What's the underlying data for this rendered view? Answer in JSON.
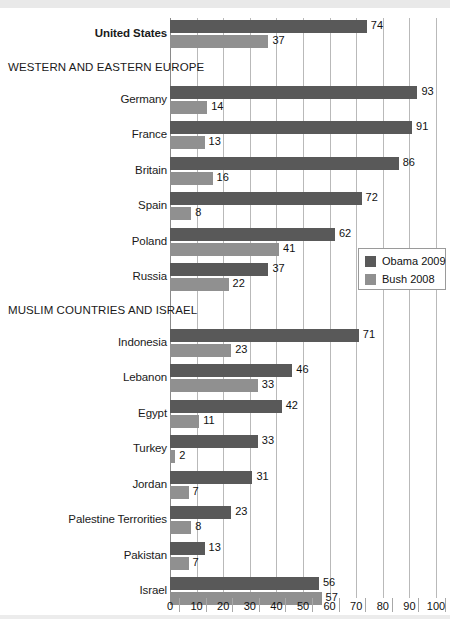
{
  "chart_data": {
    "type": "bar",
    "orientation": "horizontal",
    "title": "",
    "subtitle": "",
    "xlabel": "",
    "ylabel": "",
    "xlim": [
      0,
      100
    ],
    "xticks": [
      0,
      10,
      20,
      30,
      40,
      50,
      60,
      70,
      80,
      90,
      100
    ],
    "grid": true,
    "legend_position": "right-middle",
    "legend": [
      {
        "name": "Obama 2009",
        "color": "#595959"
      },
      {
        "name": "Bush 2008",
        "color": "#909090"
      }
    ],
    "series": [
      {
        "name": "Obama 2009",
        "color": "#595959",
        "values": [
          74,
          93,
          91,
          86,
          72,
          62,
          37,
          71,
          46,
          42,
          33,
          31,
          23,
          13,
          56
        ]
      },
      {
        "name": "Bush 2008",
        "color": "#909090",
        "values": [
          37,
          14,
          13,
          16,
          8,
          41,
          22,
          23,
          33,
          11,
          2,
          7,
          8,
          7,
          57
        ]
      }
    ],
    "categories": [
      "United States",
      "Germany",
      "France",
      "Britain",
      "Spain",
      "Poland",
      "Russia",
      "Indonesia",
      "Lebanon",
      "Egypt",
      "Turkey",
      "Jordan",
      "Palestine Terrorities",
      "Pakistan",
      "Israel"
    ],
    "group_headers": [
      {
        "label": "WESTERN AND EASTERN EUROPE",
        "before_category": "Germany"
      },
      {
        "label": "MUSLIM COUNTRIES AND ISRAEL",
        "before_category": "Indonesia"
      }
    ],
    "rows": [
      {
        "kind": "category",
        "label": "United States",
        "bold": true,
        "obama": 74,
        "bush": 37
      },
      {
        "kind": "group",
        "label": "WESTERN AND EASTERN EUROPE"
      },
      {
        "kind": "category",
        "label": "Germany",
        "bold": false,
        "obama": 93,
        "bush": 14
      },
      {
        "kind": "category",
        "label": "France",
        "bold": false,
        "obama": 91,
        "bush": 13
      },
      {
        "kind": "category",
        "label": "Britain",
        "bold": false,
        "obama": 86,
        "bush": 16
      },
      {
        "kind": "category",
        "label": "Spain",
        "bold": false,
        "obama": 72,
        "bush": 8
      },
      {
        "kind": "category",
        "label": "Poland",
        "bold": false,
        "obama": 62,
        "bush": 41
      },
      {
        "kind": "category",
        "label": "Russia",
        "bold": false,
        "obama": 37,
        "bush": 22
      },
      {
        "kind": "group",
        "label": "MUSLIM COUNTRIES AND ISRAEL"
      },
      {
        "kind": "category",
        "label": "Indonesia",
        "bold": false,
        "obama": 71,
        "bush": 23
      },
      {
        "kind": "category",
        "label": "Lebanon",
        "bold": false,
        "obama": 46,
        "bush": 33
      },
      {
        "kind": "category",
        "label": "Egypt",
        "bold": false,
        "obama": 42,
        "bush": 11
      },
      {
        "kind": "category",
        "label": "Turkey",
        "bold": false,
        "obama": 33,
        "bush": 2
      },
      {
        "kind": "category",
        "label": "Jordan",
        "bold": false,
        "obama": 31,
        "bush": 7
      },
      {
        "kind": "category",
        "label": "Palestine Terrorities",
        "bold": false,
        "obama": 23,
        "bush": 8
      },
      {
        "kind": "category",
        "label": "Pakistan",
        "bold": false,
        "obama": 13,
        "bush": 7
      },
      {
        "kind": "category",
        "label": "Israel",
        "bold": false,
        "obama": 56,
        "bush": 57
      }
    ]
  }
}
